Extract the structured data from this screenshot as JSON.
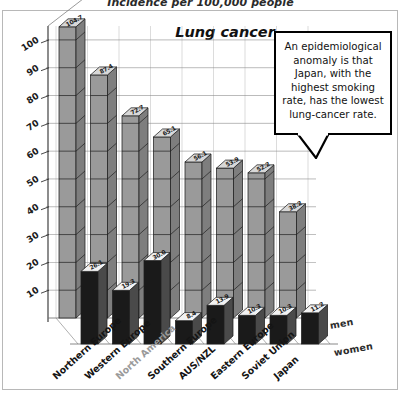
{
  "header": {
    "supra_title": "Incidence per 100,000 people",
    "chart_title": "Lung cancer"
  },
  "callout": {
    "text": "An epidemiological anomaly is that Japan, with the highest smoking rate, has the lowest lung-cancer rate."
  },
  "legend": {
    "men_label": "men",
    "women_label": "women"
  },
  "chart_data": {
    "type": "bar",
    "title": "Lung cancer",
    "subtitle": "Incidence per 100,000 people",
    "xlabel": "",
    "ylabel": "Incidence per 100,000 people",
    "ylim": [
      0,
      105
    ],
    "grid": true,
    "legend_position": "right",
    "projection": "3d-grouped-depth",
    "categories": [
      "Northern Europe",
      "Western Europe",
      "North America",
      "Southern Europe",
      "AUS/NZL",
      "Eastern Europe",
      "Soviet Union",
      "Japan"
    ],
    "category_styles": [
      "normal",
      "normal",
      "muted",
      "normal",
      "normal",
      "normal",
      "normal",
      "normal"
    ],
    "series": [
      {
        "name": "men",
        "color": "#9a9a9a",
        "values": [
          104.7,
          87.4,
          72.7,
          65.1,
          56.1,
          53.9,
          52.2,
          38.2
        ]
      },
      {
        "name": "women",
        "color": "#1a1a1a",
        "values": [
          26.1,
          19.3,
          30.0,
          8.4,
          13.9,
          10.3,
          10.3,
          11.2
        ]
      }
    ],
    "yticks": [
      10,
      20,
      30,
      40,
      50,
      60,
      70,
      80,
      90,
      100
    ],
    "annotations": [
      "An epidemiological anomaly is that Japan, with the highest smoking rate, has the lowest lung-cancer rate."
    ]
  },
  "colors": {
    "men_bar": "#9a9a9a",
    "men_bar_top": "#d8d8d8",
    "men_bar_side": "#7e7e7e",
    "women_bar": "#1a1a1a",
    "women_bar_top": "#f2f2f2",
    "women_bar_side": "#4a4a4a",
    "grid": "#8c8c8c",
    "axis": "#4a4a4a"
  }
}
